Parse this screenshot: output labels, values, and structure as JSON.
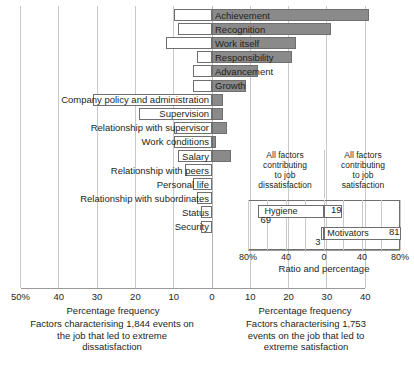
{
  "chart_data": {
    "type": "bar",
    "title": "",
    "orientation": "horizontal-diverging",
    "xlabel": "Percentage frequency",
    "ylabel": "",
    "xlim": [
      -50,
      40
    ],
    "grid": true,
    "zero": 0,
    "note": "Herzberg two-factor theory: motivators (top six) and hygiene factors (bottom ten). Left of zero = factors leading to extreme dissatisfaction; right of zero = factors leading to extreme satisfaction.",
    "series": [
      {
        "name": "Extreme satisfaction (right of zero, shaded)",
        "color": "#8a8a8a"
      },
      {
        "name": "Extreme dissatisfaction (left of zero, open)",
        "color": "#ffffff"
      }
    ],
    "categories": [
      "Achievement",
      "Recognition",
      "Work itself",
      "Responsibility",
      "Advancement",
      "Growth",
      "Company policy and administration",
      "Supervision",
      "Relationship with supervisor",
      "Work conditions",
      "Salary",
      "Relationship with peers",
      "Personal life",
      "Relationship with subordinates",
      "Status",
      "Security"
    ],
    "rows": [
      {
        "label": "Achievement",
        "group": "motivator",
        "satisfaction": 41,
        "dissatisfaction": 10,
        "label_side": "right"
      },
      {
        "label": "Recognition",
        "group": "motivator",
        "satisfaction": 31,
        "dissatisfaction": 9,
        "label_side": "right"
      },
      {
        "label": "Work itself",
        "group": "motivator",
        "satisfaction": 22,
        "dissatisfaction": 12,
        "label_side": "right"
      },
      {
        "label": "Responsibility",
        "group": "motivator",
        "satisfaction": 21,
        "dissatisfaction": 4,
        "label_side": "right"
      },
      {
        "label": "Advancement",
        "group": "motivator",
        "satisfaction": 12,
        "dissatisfaction": 5,
        "label_side": "right"
      },
      {
        "label": "Growth",
        "group": "motivator",
        "satisfaction": 9,
        "dissatisfaction": 5,
        "label_side": "right"
      },
      {
        "label": "Company policy and administration",
        "group": "hygiene",
        "satisfaction": 3,
        "dissatisfaction": 31,
        "label_side": "left"
      },
      {
        "label": "Supervision",
        "group": "hygiene",
        "satisfaction": 3,
        "dissatisfaction": 19,
        "label_side": "left"
      },
      {
        "label": "Relationship with supervisor",
        "group": "hygiene",
        "satisfaction": 4,
        "dissatisfaction": 10,
        "label_side": "left"
      },
      {
        "label": "Work conditions",
        "group": "hygiene",
        "satisfaction": 1,
        "dissatisfaction": 10,
        "label_side": "left"
      },
      {
        "label": "Salary",
        "group": "hygiene",
        "satisfaction": 5,
        "dissatisfaction": 9,
        "label_side": "left"
      },
      {
        "label": "Relationship with peers",
        "group": "hygiene",
        "satisfaction": 0,
        "dissatisfaction": 7,
        "label_side": "left"
      },
      {
        "label": "Personal life",
        "group": "hygiene",
        "satisfaction": 0,
        "dissatisfaction": 5,
        "label_side": "left"
      },
      {
        "label": "Relationship with subordinates",
        "group": "hygiene",
        "satisfaction": 0,
        "dissatisfaction": 4,
        "label_side": "left"
      },
      {
        "label": "Status",
        "group": "hygiene",
        "satisfaction": 0,
        "dissatisfaction": 3,
        "label_side": "left"
      },
      {
        "label": "Security",
        "group": "hygiene",
        "satisfaction": 0,
        "dissatisfaction": 3,
        "label_side": "left"
      }
    ],
    "axis_ticks": [
      {
        "value": -50,
        "text": "50%"
      },
      {
        "value": -40,
        "text": "40"
      },
      {
        "value": -30,
        "text": "30"
      },
      {
        "value": -20,
        "text": "20"
      },
      {
        "value": -10,
        "text": "10"
      },
      {
        "value": 0,
        "text": "0"
      },
      {
        "value": 10,
        "text": "10"
      },
      {
        "value": 20,
        "text": "20"
      },
      {
        "value": 30,
        "text": "30"
      },
      {
        "value": 40,
        "text": "40"
      }
    ],
    "captions": {
      "left_axis_title": "Percentage frequency",
      "left_caption": "Factors characterising 1,844 events on\nthe job that led to extreme\ndissatisfaction",
      "right_axis_title": "Percentage frequency",
      "right_caption": "Factors characterising 1,753\nevents on the job that led to\nextreme satisfaction"
    },
    "inset": {
      "type": "bar",
      "orientation": "horizontal-diverging",
      "xlabel": "Ratio and percentage",
      "xlim": [
        -80,
        80
      ],
      "heading_left": "All factors\ncontributing\nto job\ndissatisfaction",
      "heading_right": "All factors\ncontributing\nto job\nsatisfaction",
      "rows": [
        {
          "label": "Hygiene",
          "dissatisfaction": 69,
          "satisfaction": 19
        },
        {
          "label": "Motivators",
          "dissatisfaction": 3,
          "satisfaction": 81
        }
      ],
      "value_labels": [
        "69",
        "19",
        "3",
        "81"
      ],
      "axis_ticks": [
        {
          "value": -80,
          "text": "80%"
        },
        {
          "value": -40,
          "text": "40"
        },
        {
          "value": 0,
          "text": "0"
        },
        {
          "value": 40,
          "text": "40"
        },
        {
          "value": 80,
          "text": "80%"
        }
      ]
    },
    "colors": {
      "bar_fill": "#8a8a8a",
      "bar_stroke": "#6f6f6f",
      "open_fill": "#ffffff",
      "grid": "#c9c9c9",
      "text": "#231f20"
    }
  }
}
